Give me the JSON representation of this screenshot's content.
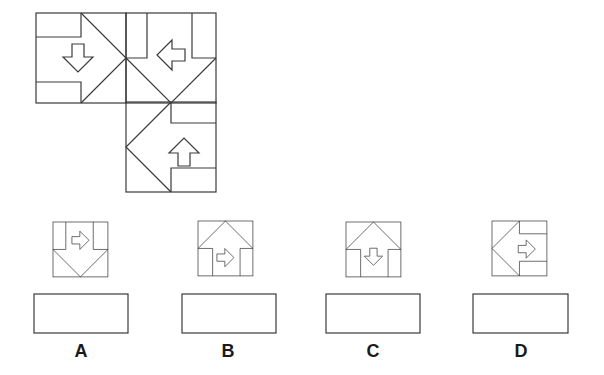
{
  "puzzle": {
    "type": "figure-pattern",
    "grid_cells": [
      {
        "row": 0,
        "col": 0,
        "chevron": "right",
        "inner_arrow": "down"
      },
      {
        "row": 0,
        "col": 1,
        "chevron": "down",
        "inner_arrow": "left"
      },
      {
        "row": 1,
        "col": 1,
        "chevron": "left",
        "inner_arrow": "up"
      },
      {
        "row": 1,
        "col": 0,
        "missing": true
      }
    ]
  },
  "options": [
    {
      "label": "A",
      "chevron": "down",
      "inner_arrow": "right"
    },
    {
      "label": "B",
      "chevron": "up",
      "inner_arrow": "right"
    },
    {
      "label": "C",
      "chevron": "up",
      "inner_arrow": "down"
    },
    {
      "label": "D",
      "chevron": "left",
      "inner_arrow": "right"
    }
  ],
  "colors": {
    "stroke": "#3a3a3a",
    "background": "#ffffff"
  }
}
